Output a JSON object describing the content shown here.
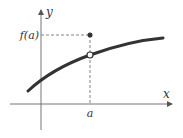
{
  "diagram": {
    "title": "",
    "labels": {
      "y_axis": "y",
      "x_axis": "x",
      "f_of_a": "f(a)",
      "a": "a"
    },
    "elements": {
      "curve": "increasing concave-down curve with a removable discontinuity at x = a",
      "open_circle": "hole on curve at x = a",
      "filled_dot": "point (a, f(a)) above the curve",
      "dashed_guides": "dashed lines from f(a) on the y-axis and from a on the x-axis to the filled dot"
    },
    "colors": {
      "curve": "#333333",
      "axes": "#555555",
      "text": "#333333"
    }
  }
}
